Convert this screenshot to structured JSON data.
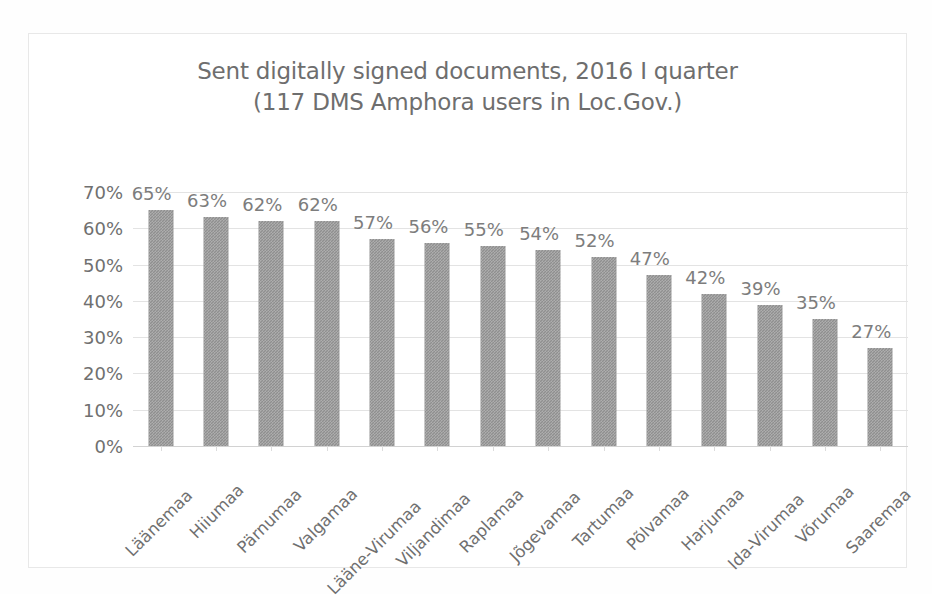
{
  "chart_data": {
    "type": "bar",
    "title": "Sent digitally signed documents, 2016 I quarter",
    "subtitle": "(117 DMS Amphora users in Loc.Gov.)",
    "title_lines": [
      "Sent digitally signed documents, 2016 I quarter",
      "(117 DMS Amphora users in Loc.Gov.)"
    ],
    "xlabel": "",
    "ylabel": "",
    "ylim": [
      0,
      70
    ],
    "ytick_values": [
      0,
      10,
      20,
      30,
      40,
      50,
      60,
      70
    ],
    "ytick_labels": [
      "0%",
      "10%",
      "20%",
      "30%",
      "40%",
      "50%",
      "60%",
      "70%"
    ],
    "grid": true,
    "legend": false,
    "legend_position": "none",
    "value_suffix": "%",
    "categories": [
      "Läänemaa",
      "Hiiumaa",
      "Pärnumaa",
      "Valgamaa",
      "Lääne-Virumaa",
      "Viljandimaa",
      "Raplamaa",
      "Jõgevamaa",
      "Tartumaa",
      "Põlvamaa",
      "Harjumaa",
      "Ida-Virumaa",
      "Võrumaa",
      "Saaremaa"
    ],
    "values": [
      65,
      63,
      62,
      62,
      57,
      56,
      55,
      54,
      52,
      47,
      42,
      39,
      35,
      27
    ],
    "data_labels": [
      "65%",
      "63%",
      "62%",
      "62%",
      "57%",
      "56%",
      "55%",
      "54%",
      "52%",
      "47%",
      "42%",
      "39%",
      "35%",
      "27%"
    ],
    "series": [
      {
        "name": "Sent digitally signed documents",
        "values": [
          65,
          63,
          62,
          62,
          57,
          56,
          55,
          54,
          52,
          47,
          42,
          39,
          35,
          27
        ]
      }
    ],
    "colors": {
      "bar_fill": "#8f8f8f",
      "gridline": "#e3e3e3",
      "axis_line": "#d2d2d2",
      "title_text": "#6e6e6e",
      "tick_text": "#707070",
      "data_label_text": "#7d7d7d",
      "plot_background": "#ffffff",
      "frame_border": "#e8e8e8"
    }
  }
}
